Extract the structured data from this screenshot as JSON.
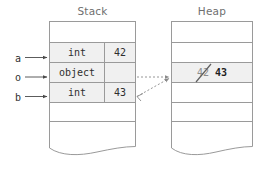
{
  "diagram": {
    "title_stack": "Stack",
    "title_heap": "Heap",
    "colors": {
      "border": "#9a9a9a",
      "filled_cell": "#f0f0f0",
      "text": "#2e2e2e",
      "title_text": "#6f6f6f",
      "arrow_solid": "#4a4a4a",
      "arrow_dotted": "#8a8a8a"
    }
  },
  "stack": {
    "label": "Stack",
    "rows": [
      {
        "id": "stack-row-0",
        "state": "empty",
        "type": "",
        "value": ""
      },
      {
        "id": "stack-row-a",
        "state": "filled",
        "type": "int",
        "value": "42"
      },
      {
        "id": "stack-row-o",
        "state": "filled",
        "type": "object",
        "value": ""
      },
      {
        "id": "stack-row-b",
        "state": "filled",
        "type": "int",
        "value": "43"
      },
      {
        "id": "stack-row-4",
        "state": "empty",
        "type": "",
        "value": ""
      },
      {
        "id": "stack-row-5",
        "state": "empty",
        "type": "",
        "value": ""
      }
    ]
  },
  "heap": {
    "label": "Heap",
    "rows": [
      {
        "id": "heap-row-0",
        "state": "empty",
        "value": ""
      },
      {
        "id": "heap-row-1",
        "state": "empty",
        "value": ""
      },
      {
        "id": "heap-row-2",
        "state": "filled",
        "old_value": "42",
        "new_value": "43",
        "old_value_struck": true
      },
      {
        "id": "heap-row-3",
        "state": "empty",
        "value": ""
      },
      {
        "id": "heap-row-4",
        "state": "empty",
        "value": ""
      },
      {
        "id": "heap-row-5",
        "state": "empty",
        "value": ""
      }
    ]
  },
  "variables": [
    {
      "name": "a",
      "points_to": "stack-row-a"
    },
    {
      "name": "o",
      "points_to": "stack-row-o"
    },
    {
      "name": "b",
      "points_to": "stack-row-b"
    }
  ],
  "references": [
    {
      "from": "stack-row-o",
      "to": "heap-row-2",
      "style": "dotted"
    },
    {
      "from": "stack-row-b",
      "to": "heap-row-2",
      "style": "dotted"
    }
  ]
}
